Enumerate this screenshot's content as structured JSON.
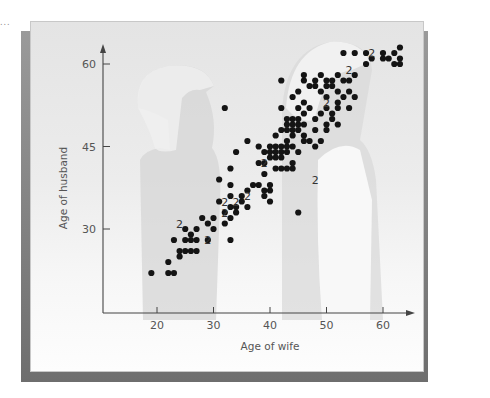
{
  "chart_data": {
    "type": "scatter",
    "title": "",
    "xlabel": "Age of wife",
    "ylabel": "Age of husband",
    "xlim": [
      14,
      66
    ],
    "ylim": [
      14,
      63
    ],
    "xticks": [
      20,
      30,
      40,
      50,
      60
    ],
    "yticks": [
      30,
      45,
      60
    ],
    "grid": false,
    "legend": null,
    "annotation": "Numeral '2' beside a point indicates two couples at that location",
    "points": [
      [
        19,
        22
      ],
      [
        22,
        22
      ],
      [
        23,
        22
      ],
      [
        22,
        24
      ],
      [
        24,
        25
      ],
      [
        25,
        26
      ],
      [
        24,
        26
      ],
      [
        26,
        26
      ],
      [
        27,
        26
      ],
      [
        23,
        28
      ],
      [
        25,
        28
      ],
      [
        26,
        28
      ],
      [
        27,
        28
      ],
      [
        29,
        28
      ],
      [
        33,
        28
      ],
      [
        25,
        30
      ],
      [
        26,
        29
      ],
      [
        27,
        30
      ],
      [
        30,
        30
      ],
      [
        29,
        31
      ],
      [
        28,
        32
      ],
      [
        30,
        32
      ],
      [
        32,
        31
      ],
      [
        33,
        32
      ],
      [
        32,
        33
      ],
      [
        33,
        34
      ],
      [
        34,
        33
      ],
      [
        34,
        34
      ],
      [
        31,
        35
      ],
      [
        33,
        36
      ],
      [
        35,
        35
      ],
      [
        35,
        36
      ],
      [
        36,
        37
      ],
      [
        36,
        34
      ],
      [
        37,
        38
      ],
      [
        38,
        38
      ],
      [
        39,
        36
      ],
      [
        39,
        37
      ],
      [
        40,
        35
      ],
      [
        40,
        37
      ],
      [
        40,
        38
      ],
      [
        41,
        41
      ],
      [
        42,
        41
      ],
      [
        43,
        41
      ],
      [
        44,
        41
      ],
      [
        39,
        40
      ],
      [
        38,
        42
      ],
      [
        39,
        42
      ],
      [
        40,
        43
      ],
      [
        41,
        43
      ],
      [
        42,
        43
      ],
      [
        44,
        42
      ],
      [
        40,
        44
      ],
      [
        41,
        44
      ],
      [
        42,
        44
      ],
      [
        43,
        44
      ],
      [
        45,
        44
      ],
      [
        40,
        45
      ],
      [
        41,
        45
      ],
      [
        42,
        45
      ],
      [
        43,
        45
      ],
      [
        44,
        45
      ],
      [
        36,
        46
      ],
      [
        41,
        47
      ],
      [
        43,
        46
      ],
      [
        44,
        47
      ],
      [
        46,
        46
      ],
      [
        42,
        48
      ],
      [
        43,
        48
      ],
      [
        44,
        48
      ],
      [
        45,
        48
      ],
      [
        46,
        47
      ],
      [
        47,
        46
      ],
      [
        48,
        45
      ],
      [
        49,
        46
      ],
      [
        45,
        33
      ],
      [
        43,
        49
      ],
      [
        44,
        49
      ],
      [
        45,
        49
      ],
      [
        46,
        49
      ],
      [
        48,
        48
      ],
      [
        48,
        50
      ],
      [
        50,
        49
      ],
      [
        50,
        48
      ],
      [
        43,
        50
      ],
      [
        44,
        50
      ],
      [
        45,
        50
      ],
      [
        46,
        51
      ],
      [
        49,
        51
      ],
      [
        51,
        50
      ],
      [
        52,
        49
      ],
      [
        42,
        52
      ],
      [
        45,
        52
      ],
      [
        47,
        52
      ],
      [
        50,
        52
      ],
      [
        51,
        51
      ],
      [
        52,
        52
      ],
      [
        54,
        52
      ],
      [
        44,
        54
      ],
      [
        46,
        53
      ],
      [
        49,
        55
      ],
      [
        50,
        54
      ],
      [
        51,
        56
      ],
      [
        52,
        53
      ],
      [
        53,
        54
      ],
      [
        54,
        55
      ],
      [
        55,
        54
      ],
      [
        45,
        55
      ],
      [
        48,
        56
      ],
      [
        50,
        56
      ],
      [
        51,
        57
      ],
      [
        52,
        55
      ],
      [
        42,
        57
      ],
      [
        46,
        57
      ],
      [
        47,
        56
      ],
      [
        48,
        57
      ],
      [
        54,
        57
      ],
      [
        55,
        58
      ],
      [
        46,
        58
      ],
      [
        49,
        58
      ],
      [
        50,
        57
      ],
      [
        52,
        58
      ],
      [
        53,
        57
      ],
      [
        57,
        60
      ],
      [
        58,
        61
      ],
      [
        60,
        61
      ],
      [
        63,
        60
      ],
      [
        63,
        61
      ],
      [
        62,
        60
      ],
      [
        61,
        61
      ],
      [
        53,
        62
      ],
      [
        55,
        62
      ],
      [
        57,
        62
      ],
      [
        60,
        62
      ],
      [
        62,
        62
      ],
      [
        63,
        63
      ],
      [
        32,
        52
      ],
      [
        34,
        44
      ],
      [
        33,
        41
      ],
      [
        38,
        45
      ],
      [
        39,
        44
      ],
      [
        33,
        38
      ],
      [
        31,
        39
      ]
    ],
    "doubles": [
      [
        24,
        31
      ],
      [
        29,
        28
      ],
      [
        32,
        35
      ],
      [
        32,
        33
      ],
      [
        34,
        35
      ],
      [
        36,
        36
      ],
      [
        39,
        42
      ],
      [
        48,
        39
      ],
      [
        50,
        53
      ],
      [
        54,
        59
      ],
      [
        58,
        62
      ]
    ]
  },
  "labels": {
    "double_marker": "2",
    "corner_mark": "..."
  }
}
